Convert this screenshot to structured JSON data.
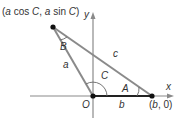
{
  "diagram": {
    "title": "",
    "colors": {
      "line": "#8a8a8a",
      "text": "#333333",
      "point": "#111111",
      "axis": "#8a8a8a"
    },
    "points": {
      "top": {
        "label": "(a cos C, a sin C)",
        "label_parts": [
          "(",
          "a",
          " cos ",
          "C",
          ", ",
          "a",
          " sin ",
          "C",
          ")"
        ]
      },
      "origin": {
        "label": "O"
      },
      "right": {
        "label": "(b, 0)",
        "label_parts": [
          "(",
          "b",
          ", 0)"
        ]
      }
    },
    "axes": {
      "x_label": "x",
      "y_label": "y"
    },
    "sides": {
      "a": "a",
      "b": "b",
      "c": "c"
    },
    "angles": {
      "A": "A",
      "B": "B",
      "C": "C"
    }
  }
}
